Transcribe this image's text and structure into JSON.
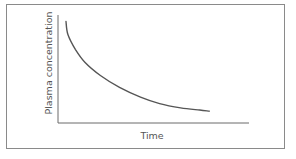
{
  "chart_data": {
    "type": "line",
    "title": "",
    "xlabel": "Time",
    "ylabel": "Plasma concentration",
    "x_ticks": [],
    "y_ticks": [],
    "grid": false,
    "legend": null,
    "series": [
      {
        "name": "Plasma concentration",
        "description": "Exponential decay curve: concentration falls steeply then levels off over time",
        "x": [
          0.0,
          0.01,
          0.05,
          0.1,
          0.18,
          0.28,
          0.39,
          0.49,
          0.6,
          0.7,
          0.75
        ],
        "values": [
          0.94,
          0.82,
          0.68,
          0.56,
          0.44,
          0.33,
          0.24,
          0.18,
          0.14,
          0.12,
          0.11
        ]
      }
    ],
    "xlim": [
      0,
      1
    ],
    "ylim": [
      0,
      1
    ]
  },
  "colors": {
    "axis": "#6b6b6b",
    "curve": "#555555",
    "frame": "#8a8a8a"
  }
}
